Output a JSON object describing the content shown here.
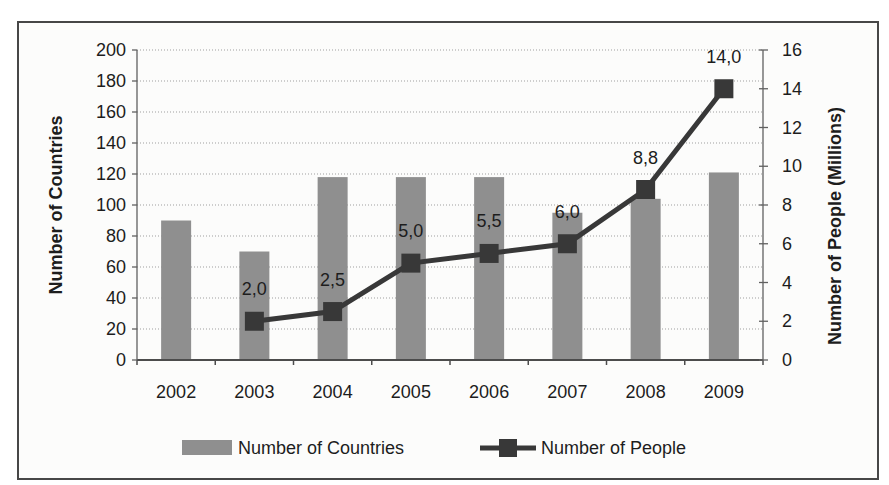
{
  "chart_data": {
    "type": "combo",
    "title": "",
    "categories": [
      "2002",
      "2003",
      "2004",
      "2005",
      "2006",
      "2007",
      "2008",
      "2009"
    ],
    "series": [
      {
        "name": "Number of Countries",
        "chart": "bar",
        "axis": "left",
        "values": [
          90,
          70,
          118,
          118,
          118,
          95,
          104,
          121
        ]
      },
      {
        "name": "Number of People",
        "chart": "line",
        "axis": "right",
        "marker": "square",
        "values": [
          null,
          2.0,
          2.5,
          5.0,
          5.5,
          6.0,
          8.8,
          14.0
        ],
        "point_labels": [
          "",
          "2,0",
          "2,5",
          "5,0",
          "5,5",
          "6,0",
          "8,8",
          "14,0"
        ]
      }
    ],
    "left_axis": {
      "label": "Number of Countries",
      "min": 0,
      "max": 200,
      "step": 20,
      "ticks": [
        "0",
        "20",
        "40",
        "60",
        "80",
        "100",
        "120",
        "140",
        "160",
        "180",
        "200"
      ]
    },
    "right_axis": {
      "label": "Number of People (Millions)",
      "min": 0,
      "max": 16,
      "step": 2,
      "ticks": [
        "0",
        "2",
        "4",
        "6",
        "8",
        "10",
        "12",
        "14",
        "16"
      ]
    },
    "grid": "horizontal-dotted",
    "legend_position": "bottom",
    "legend": [
      {
        "label": "Number of Countries",
        "swatch": "bar"
      },
      {
        "label": "Number of People",
        "swatch": "line-marker"
      }
    ],
    "colors": {
      "bar": "#8f8f8f",
      "line": "#383838",
      "marker": "#383838",
      "grid": "#9f9f9f",
      "axis": "#606060",
      "baseline": "#4c4c4c",
      "text": "#1d1d1d",
      "frame": "#474747",
      "background": "#fcfcfb"
    }
  }
}
